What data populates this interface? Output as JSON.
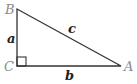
{
  "diagram": {
    "type": "right-triangle",
    "vertices": [
      {
        "label": "B",
        "x": 17,
        "y": 9
      },
      {
        "label": "C",
        "x": 17,
        "y": 66
      },
      {
        "label": "A",
        "x": 121,
        "y": 66
      }
    ],
    "sides": [
      {
        "label": "a",
        "between": "B-C"
      },
      {
        "label": "b",
        "between": "C-A"
      },
      {
        "label": "c",
        "between": "B-A"
      }
    ],
    "right_angle_at": "C",
    "colors": {
      "line": "#333333",
      "vertex_label": "#8a8a8a",
      "side_label": "#222222"
    }
  }
}
